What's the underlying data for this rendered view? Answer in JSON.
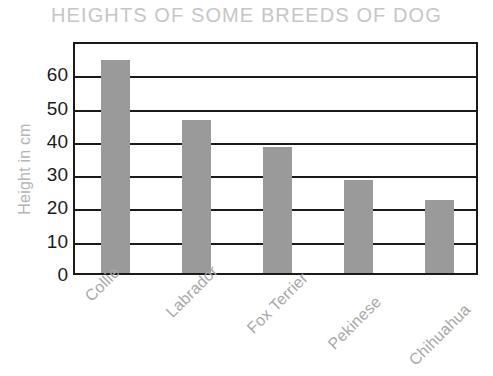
{
  "chart_data": {
    "type": "bar",
    "title": "HEIGHTS OF SOME BREEDS OF DOG",
    "xlabel": "",
    "ylabel": "Height in cm",
    "categories": [
      "Collie",
      "Labrador",
      "Fox Terrier",
      "Pekinese",
      "Chihuahua"
    ],
    "values": [
      64,
      46,
      38,
      28,
      22
    ],
    "ylim": [
      0,
      70
    ],
    "yticks": [
      0,
      10,
      20,
      30,
      40,
      50,
      60
    ],
    "ytick_labels": [
      "0",
      "10",
      "20",
      "30",
      "40",
      "50",
      "60"
    ],
    "grid": true,
    "legend": false,
    "bar_color": "#9a9a9a",
    "title_color": "#c6c6c6",
    "axis_color": "#1a1a1a",
    "label_color": "#a8a8a8"
  }
}
